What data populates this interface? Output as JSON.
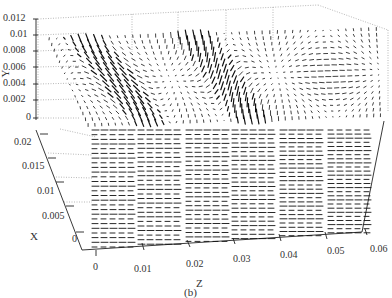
{
  "chart_data": {
    "type": "quiver3d",
    "title": "",
    "caption": "(b)",
    "axes": {
      "y": {
        "label": "Y",
        "ticks": [
          "0",
          "0.002",
          "0.004",
          "0.006",
          "0.008",
          "0.01",
          "0.012"
        ],
        "range": [
          0,
          0.012
        ]
      },
      "x": {
        "label": "X",
        "ticks": [
          "0",
          "0.005",
          "0.01",
          "0.015",
          "0.02"
        ],
        "range": [
          0,
          0.02
        ]
      },
      "z": {
        "label": "Z",
        "ticks": [
          "0",
          "0.01",
          "0.02",
          "0.03",
          "0.04",
          "0.05",
          "0.06"
        ],
        "range": [
          0,
          0.06
        ]
      }
    },
    "grid": true,
    "vortex_centers_z": [
      0.01,
      0.03
    ],
    "legend": []
  },
  "labels": {
    "y_ticks": [
      "0.012",
      "0.01",
      "0.008",
      "0.006",
      "0.004",
      "0.002",
      "0"
    ],
    "x_ticks": [
      "0.02",
      "0.015",
      "0.01",
      "0.005",
      "0"
    ],
    "z_ticks": [
      "0",
      "0.01",
      "0.02",
      "0.03",
      "0.04",
      "0.05",
      "0.06"
    ],
    "y_title": "Y",
    "x_title": "X",
    "z_title": "Z",
    "caption": "(b)"
  }
}
